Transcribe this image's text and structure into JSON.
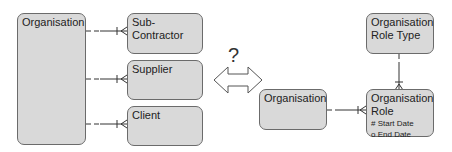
{
  "left_model": {
    "organisation": "Organisation",
    "subtypes": [
      "Sub-Contractor",
      "Supplier",
      "Client"
    ]
  },
  "comparison": {
    "symbol": "?"
  },
  "right_model": {
    "organisation": "Organisation",
    "role_type": "Organisation Role Type",
    "role": {
      "name": "Organisation Role",
      "attributes": [
        "# Start Date",
        "o End Date"
      ]
    }
  }
}
